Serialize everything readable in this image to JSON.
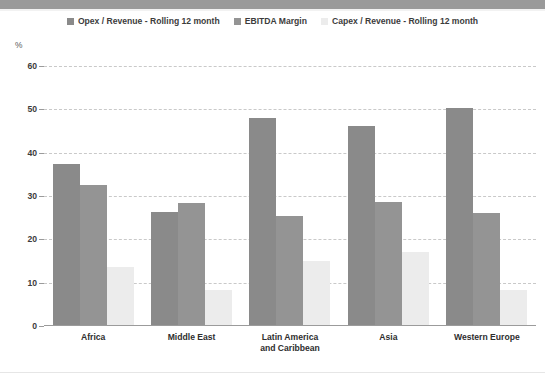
{
  "chart_data": {
    "type": "bar",
    "title": "",
    "subtitle": "",
    "xlabel": "",
    "ylabel": "%",
    "ylim": [
      0,
      60
    ],
    "yticks": [
      0,
      10,
      20,
      30,
      40,
      50,
      60
    ],
    "ytick_labels": [
      "0",
      "10",
      "20",
      "30",
      "40",
      "50",
      "60"
    ],
    "grid": true,
    "legend_position": "top-center",
    "categories": [
      "Africa",
      "Middle East",
      "Latin America and Caribbean",
      "Asia",
      "Western Europe"
    ],
    "category_lines": [
      [
        "Africa"
      ],
      [
        "Middle East"
      ],
      [
        "Latin America",
        "and Caribbean"
      ],
      [
        "Asia"
      ],
      [
        "Western Europe"
      ]
    ],
    "series": [
      {
        "name": "Opex / Revenue - Rolling 12 month",
        "color": "#8a8a8a",
        "values": [
          37.4,
          26.3,
          48.0,
          46.1,
          50.3
        ]
      },
      {
        "name": "EBITDA Margin",
        "color": "#949494",
        "values": [
          32.6,
          28.5,
          25.5,
          28.7,
          26.1
        ]
      },
      {
        "name": "Capex / Revenue - Rolling 12 month",
        "color": "#ececec",
        "values": [
          13.7,
          8.3,
          15.0,
          17.0,
          8.3
        ]
      }
    ]
  },
  "legend": {
    "items": [
      {
        "label": "Opex / Revenue - Rolling 12 month",
        "color": "#8a8a8a"
      },
      {
        "label": "EBITDA Margin",
        "color": "#949494"
      },
      {
        "label": "Capex / Revenue - Rolling 12 month",
        "color": "#ececec"
      }
    ]
  },
  "axis": {
    "unit_label": "%"
  },
  "colors": {
    "top_band": "#9a9a9a",
    "gridline": "#c9c9c9",
    "axis": "#9b9b9b",
    "text": "#3c3c3c",
    "background": "#ffffff"
  }
}
